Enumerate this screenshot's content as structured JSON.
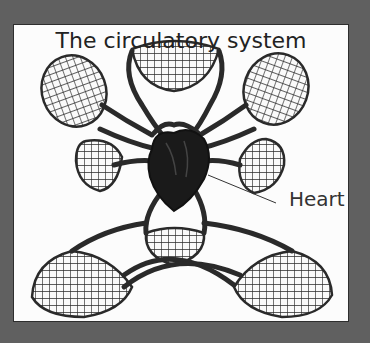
{
  "figure": {
    "title": "The circulatory system",
    "labels": [
      {
        "text": "Heart",
        "points_to": "heart"
      }
    ]
  },
  "diagram": {
    "type": "anatomical-schematic",
    "components": [
      "heart",
      "arteries-and-veins",
      "capillary-beds"
    ],
    "capillary_bed_count": 9
  },
  "colors": {
    "frame": "#606060",
    "panel": "#fcfcfc",
    "ink": "#2a2a2a",
    "heart": "#1a1a1a"
  }
}
